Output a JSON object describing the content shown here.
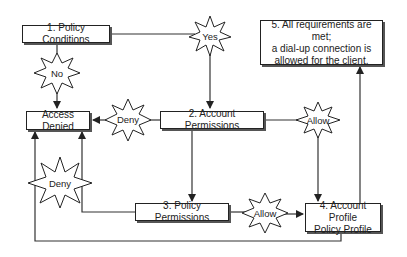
{
  "nodes": {
    "policy_conditions": "1. Policy Conditions",
    "access_denied": "Access Denied",
    "account_permissions": "2. Account Permissions",
    "policy_permissions": "3. Policy Permissions",
    "account_profile_line1": "4. Account Profile",
    "account_profile_line2": "Policy Profile",
    "requirements_line1": "5. All requirements are met;",
    "requirements_line2": "a dial-up connection is",
    "requirements_line3": "allowed for the client."
  },
  "decisions": {
    "yes": "Yes",
    "no": "No",
    "deny_top": "Deny",
    "allow_top": "Allow",
    "deny_bottom": "Deny",
    "allow_bottom": "Allow"
  },
  "colors": {
    "line": "#333333",
    "box_border": "#222222",
    "shadow": "#555555"
  }
}
